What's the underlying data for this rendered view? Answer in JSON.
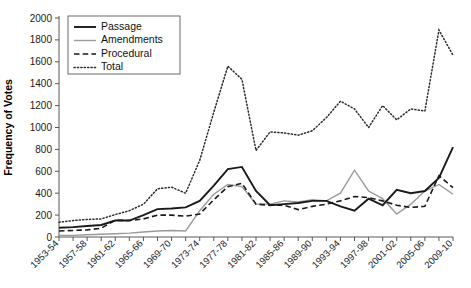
{
  "chart_data": {
    "type": "line",
    "title": "",
    "xlabel": "",
    "ylabel": "Frequency of Votes",
    "ylim": [
      0,
      2000
    ],
    "ytick_step": 200,
    "yticks": [
      0,
      200,
      400,
      600,
      800,
      1000,
      1200,
      1400,
      1600,
      1800,
      2000
    ],
    "grid": false,
    "legend_position": "top-left",
    "x": [
      "1953-54",
      "1955-56",
      "1957-58",
      "1959-60",
      "1961-62",
      "1963-64",
      "1965-66",
      "1967-68",
      "1969-70",
      "1971-72",
      "1973-74",
      "1975-76",
      "1977-78",
      "1979-80",
      "1981-82",
      "1983-84",
      "1985-86",
      "1987-88",
      "1989-90",
      "1991-92",
      "1993-94",
      "1995-96",
      "1997-98",
      "1999-00",
      "2001-02",
      "2003-04",
      "2005-06",
      "2007-08",
      "2009-10"
    ],
    "xtick_labels": [
      "1953-54",
      "1957-58",
      "1961-62",
      "1965-66",
      "1969-70",
      "1973-74",
      "1977-78",
      "1981-82",
      "1985-86",
      "1989-90",
      "1993-94",
      "1997-98",
      "2001-02",
      "2005-06",
      "2009-10"
    ],
    "series": [
      {
        "name": "Passage",
        "color": "#1a1a1a",
        "style": "solid",
        "values": [
          85,
          90,
          100,
          110,
          150,
          150,
          200,
          255,
          260,
          270,
          330,
          470,
          620,
          640,
          420,
          290,
          300,
          310,
          330,
          330,
          280,
          240,
          350,
          290,
          430,
          400,
          420,
          540,
          820
        ]
      },
      {
        "name": "Amendments",
        "color": "#9a9a9a",
        "style": "solid",
        "values": [
          15,
          15,
          20,
          25,
          30,
          35,
          45,
          55,
          60,
          55,
          240,
          390,
          480,
          460,
          300,
          300,
          330,
          320,
          340,
          330,
          400,
          610,
          420,
          350,
          210,
          300,
          420,
          480,
          390
        ]
      },
      {
        "name": "Procedural",
        "color": "#1a1a1a",
        "style": "dashed",
        "values": [
          55,
          60,
          65,
          80,
          155,
          150,
          165,
          200,
          200,
          190,
          210,
          340,
          460,
          490,
          300,
          290,
          290,
          250,
          280,
          300,
          330,
          370,
          360,
          330,
          290,
          270,
          280,
          560,
          450
        ]
      },
      {
        "name": "Total",
        "color": "#2b2b2b",
        "style": "dotted",
        "values": [
          135,
          150,
          160,
          165,
          205,
          240,
          300,
          440,
          455,
          400,
          700,
          1140,
          1560,
          1440,
          790,
          960,
          950,
          930,
          970,
          1090,
          1240,
          1170,
          1000,
          1200,
          1070,
          1170,
          1150,
          1890,
          1660
        ]
      }
    ]
  },
  "legend": {
    "items": [
      {
        "label": "Passage"
      },
      {
        "label": "Amendments"
      },
      {
        "label": "Procedural"
      },
      {
        "label": "Total"
      }
    ]
  }
}
